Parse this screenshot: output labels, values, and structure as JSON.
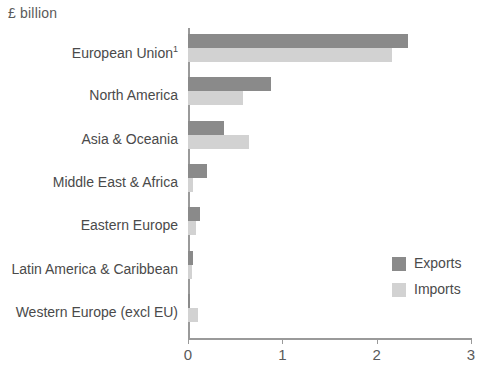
{
  "unit_label": "£ billion",
  "legend": {
    "items": [
      {
        "label": "Exports",
        "color": "#8a8a8a"
      },
      {
        "label": "Imports",
        "color": "#d2d2d2"
      }
    ]
  },
  "axis": {
    "tick_labels": [
      "0",
      "1",
      "2",
      "3"
    ]
  },
  "chart_data": {
    "type": "bar",
    "orientation": "horizontal",
    "title": "",
    "subtitle": "",
    "xlabel": "£ billion",
    "ylabel": "",
    "xlim": [
      0,
      3
    ],
    "xticks": [
      0,
      1,
      2,
      3
    ],
    "grid": false,
    "legend_position": "bottom-right",
    "categories": [
      "European Union¹",
      "North America",
      "Asia & Oceania",
      "Middle East & Africa",
      "Eastern Europe",
      "Latin America & Caribbean",
      "Western Europe (excl EU)"
    ],
    "series": [
      {
        "name": "Exports",
        "color": "#8a8a8a",
        "values": [
          2.33,
          0.88,
          0.38,
          0.2,
          0.13,
          0.05,
          0.02
        ]
      },
      {
        "name": "Imports",
        "color": "#d2d2d2",
        "values": [
          2.16,
          0.58,
          0.65,
          0.05,
          0.09,
          0.04,
          0.11
        ]
      }
    ],
    "footnote_marker": "1"
  }
}
